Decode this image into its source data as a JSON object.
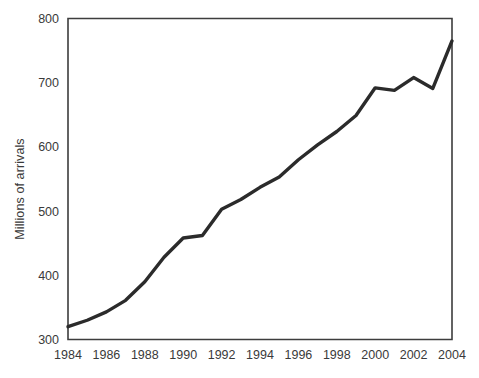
{
  "chart_data": {
    "type": "line",
    "title": "",
    "xlabel": "",
    "ylabel": "Millions of arrivals",
    "xlim": [
      1984,
      2004
    ],
    "ylim": [
      300,
      800
    ],
    "grid": false,
    "legend": "none",
    "x": [
      1984,
      1985,
      1986,
      1987,
      1988,
      1989,
      1990,
      1991,
      1992,
      1993,
      1994,
      1995,
      1996,
      1997,
      1998,
      1999,
      2000,
      2001,
      2002,
      2003,
      2004
    ],
    "values": [
      320,
      330,
      343,
      361,
      390,
      428,
      458,
      462,
      503,
      518,
      537,
      553,
      580,
      603,
      624,
      649,
      692,
      688,
      708,
      691,
      765
    ],
    "series": [
      {
        "name": "International tourist arrivals",
        "color": "#2b2b2b",
        "values": [
          320,
          330,
          343,
          361,
          390,
          428,
          458,
          462,
          503,
          518,
          537,
          553,
          580,
          603,
          624,
          649,
          692,
          688,
          708,
          691,
          765
        ]
      }
    ],
    "x_tick_labels": [
      "1984",
      "1986",
      "1988",
      "1990",
      "1992",
      "1994",
      "1996",
      "1998",
      "2000",
      "2002",
      "2004"
    ],
    "x_tick_values": [
      1984,
      1986,
      1988,
      1990,
      1992,
      1994,
      1996,
      1998,
      2000,
      2002,
      2004
    ],
    "y_tick_labels": [
      "300",
      "400",
      "500",
      "600",
      "700",
      "800"
    ],
    "y_tick_values": [
      300,
      400,
      500,
      600,
      700,
      800
    ],
    "background_color": "#ffffff",
    "axis_color": "#3d3d3d",
    "tick_label_color": "#3a3a3a"
  }
}
